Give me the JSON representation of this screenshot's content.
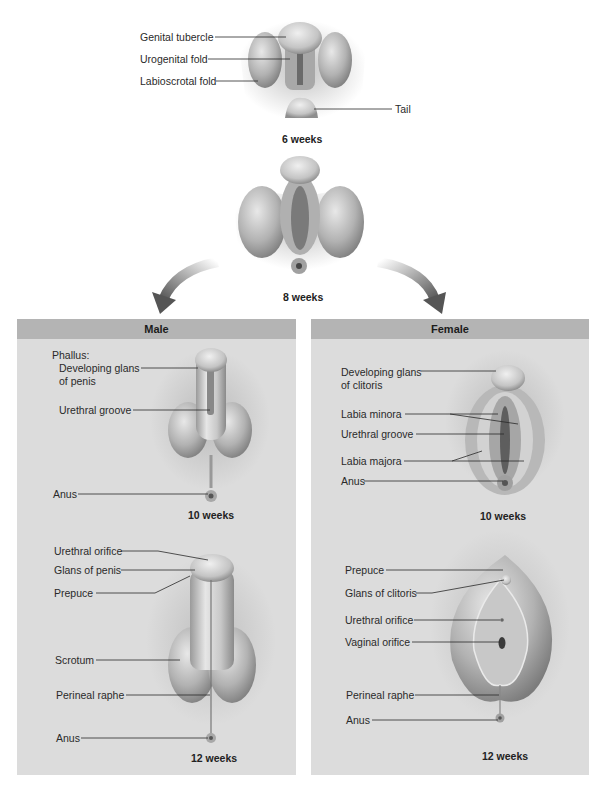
{
  "colors": {
    "panel_body": "#dcdcdc",
    "panel_header": "#b4b4b4",
    "tissue_light": "#d9d9d9",
    "tissue_mid": "#a9a9a9",
    "tissue_dark": "#6e6e6e",
    "arrow": "#5a5a5a",
    "leader_line": "#2a2a2a"
  },
  "indifferent": {
    "week6": {
      "stage_label": "6 weeks",
      "labels": [
        {
          "text": "Genital tubercle"
        },
        {
          "text": "Urogenital fold"
        },
        {
          "text": "Labioscrotal fold"
        },
        {
          "text": "Tail"
        }
      ]
    },
    "week8": {
      "stage_label": "8 weeks"
    }
  },
  "arrows": [
    {
      "name": "arrow-to-male",
      "direction": "down-left"
    },
    {
      "name": "arrow-to-female",
      "direction": "down-right"
    }
  ],
  "male": {
    "title": "Male",
    "week10": {
      "stage_label": "10 weeks",
      "heading": "Phallus:",
      "labels": [
        {
          "text": "Developing glans"
        },
        {
          "text": "of penis"
        },
        {
          "text": "Urethral groove"
        },
        {
          "text": "Anus"
        }
      ]
    },
    "week12": {
      "stage_label": "12 weeks",
      "labels": [
        {
          "text": "Urethral orifice"
        },
        {
          "text": "Glans of penis"
        },
        {
          "text": "Prepuce"
        },
        {
          "text": "Scrotum"
        },
        {
          "text": "Perineal raphe"
        },
        {
          "text": "Anus"
        }
      ]
    }
  },
  "female": {
    "title": "Female",
    "week10": {
      "stage_label": "10 weeks",
      "labels": [
        {
          "text": "Developing glans"
        },
        {
          "text": "of clitoris"
        },
        {
          "text": "Labia minora"
        },
        {
          "text": "Urethral groove"
        },
        {
          "text": "Labia majora"
        },
        {
          "text": "Anus"
        }
      ]
    },
    "week12": {
      "stage_label": "12 weeks",
      "labels": [
        {
          "text": "Prepuce"
        },
        {
          "text": "Glans of clitoris"
        },
        {
          "text": "Urethral orifice"
        },
        {
          "text": "Vaginal orifice"
        },
        {
          "text": "Perineal raphe"
        },
        {
          "text": "Anus"
        }
      ]
    }
  }
}
